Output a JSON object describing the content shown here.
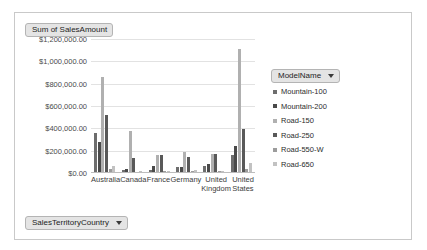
{
  "value_field_button": {
    "label": "Sum of SalesAmount"
  },
  "category_field_button": {
    "label": "SalesTerritoryCountry"
  },
  "legend_field_button": {
    "label": "ModelName"
  },
  "chart_data": {
    "type": "bar",
    "title": "Sum of SalesAmount",
    "xlabel": "SalesTerritoryCountry",
    "ylabel": "Sum of SalesAmount",
    "grid": true,
    "legend_position": "right",
    "legend_title": "ModelName",
    "ylim": [
      0,
      1200000
    ],
    "ytick_labels": [
      "$1,200,000.00",
      "$1,000,000.00",
      "$800,000.00",
      "$600,000.00",
      "$400,000.00",
      "$200,000.00",
      "$0.00"
    ],
    "ytick_values": [
      1200000,
      1000000,
      800000,
      600000,
      400000,
      200000,
      0
    ],
    "categories": [
      "Australia",
      "Canada",
      "France",
      "Germany",
      "United Kingdom",
      "United States"
    ],
    "series": [
      {
        "name": "Mountain-100",
        "color": "#6d6d6d",
        "values": [
          360000,
          28000,
          30000,
          50000,
          62000,
          160000
        ]
      },
      {
        "name": "Mountain-200",
        "color": "#4a4a4a",
        "values": [
          280000,
          34000,
          62000,
          52000,
          82000,
          240000
        ]
      },
      {
        "name": "Road-150",
        "color": "#b0b0b0",
        "values": [
          860000,
          372000,
          165000,
          190000,
          168000,
          1110000
        ]
      },
      {
        "name": "Road-250",
        "color": "#595959",
        "values": [
          520000,
          130000,
          165000,
          140000,
          172000,
          390000
        ]
      },
      {
        "name": "Road-550-W",
        "color": "#9c9c9c",
        "values": [
          38000,
          10000,
          14000,
          22000,
          16000,
          38000
        ]
      },
      {
        "name": "Road-650",
        "color": "#c2c2c2",
        "values": [
          66000,
          16000,
          18000,
          24000,
          20000,
          88000
        ]
      }
    ]
  }
}
